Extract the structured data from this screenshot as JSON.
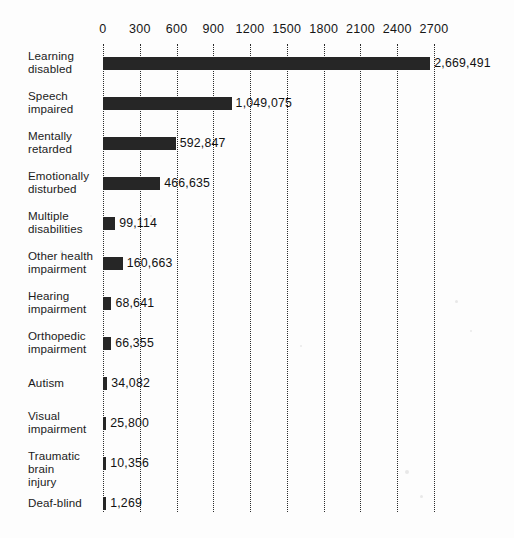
{
  "chart_data": {
    "type": "bar",
    "orientation": "horizontal",
    "title": "",
    "subtitle": "",
    "xlabel": "",
    "ylabel": "",
    "xlim": [
      0,
      2700
    ],
    "units_note": "values shown in thousands on axis; data labels show exact counts",
    "grid": true,
    "grid_style": "dotted-vertical",
    "legend": "none",
    "axis_ticks": [
      0,
      300,
      600,
      900,
      1200,
      1500,
      1800,
      2100,
      2400,
      2700
    ],
    "axis_tick_labels": [
      "0",
      "300",
      "600",
      "900",
      "1200",
      "1500",
      "1800",
      "2100",
      "2400",
      "2700"
    ],
    "categories": [
      "Learning disabled",
      "Speech impaired",
      "Mentally retarded",
      "Emotionally disturbed",
      "Multiple disabilities",
      "Other health impairment",
      "Hearing impairment",
      "Orthopedic impairment",
      "Autism",
      "Visual impairment",
      "Traumatic brain injury",
      "Deaf-blind"
    ],
    "values": [
      2669491,
      1049075,
      592847,
      466635,
      99114,
      160663,
      68641,
      66355,
      34082,
      25800,
      10356,
      1269
    ],
    "value_labels": [
      "2,669,491",
      "1,049,075",
      "592,847",
      "466,635",
      "99,114",
      "160,663",
      "68,641",
      "66,355",
      "34,082",
      "25,800",
      "10,356",
      "1,269"
    ],
    "bar_color": "#262626",
    "background_color": "#fdfdfd"
  },
  "rows": [
    {
      "label_line1": "Learning",
      "label_line2": "disabled",
      "value": 2669491,
      "value_label": "2,669,491"
    },
    {
      "label_line1": "Speech",
      "label_line2": "impaired",
      "value": 1049075,
      "value_label": "1,049,075"
    },
    {
      "label_line1": "Mentally",
      "label_line2": "retarded",
      "value": 592847,
      "value_label": "592,847"
    },
    {
      "label_line1": "Emotionally",
      "label_line2": "disturbed",
      "value": 466635,
      "value_label": "466,635"
    },
    {
      "label_line1": "Multiple",
      "label_line2": "disabilities",
      "value": 99114,
      "value_label": "99,114"
    },
    {
      "label_line1": "Other health",
      "label_line2": "impairment",
      "value": 160663,
      "value_label": "160,663"
    },
    {
      "label_line1": "Hearing",
      "label_line2": "impairment",
      "value": 68641,
      "value_label": "68,641"
    },
    {
      "label_line1": "Orthopedic",
      "label_line2": "impairment",
      "value": 66355,
      "value_label": "66,355"
    },
    {
      "label_line1": "Autism",
      "label_line2": "",
      "value": 34082,
      "value_label": "34,082"
    },
    {
      "label_line1": "Visual",
      "label_line2": "impairment",
      "value": 25800,
      "value_label": "25,800"
    },
    {
      "label_line1": "Traumatic brain",
      "label_line2": "injury",
      "value": 10356,
      "value_label": "10,356"
    },
    {
      "label_line1": "Deaf-blind",
      "label_line2": "",
      "value": 1269,
      "value_label": "1,269"
    }
  ]
}
